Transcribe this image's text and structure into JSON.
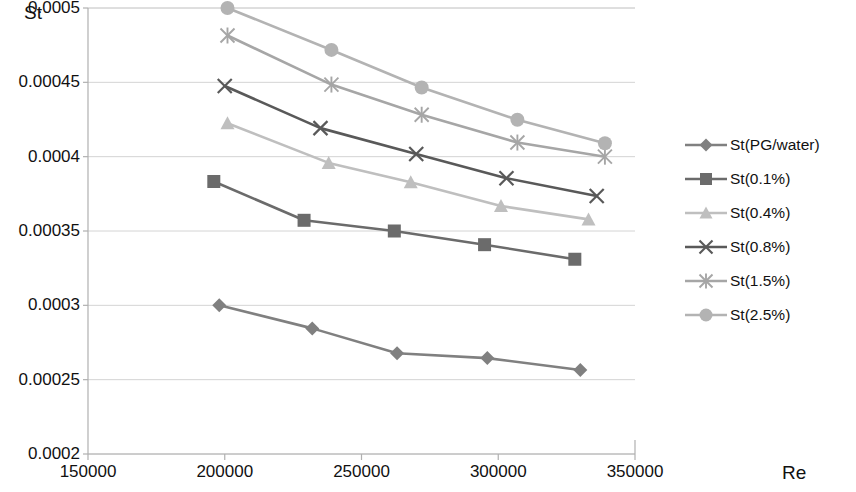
{
  "chart_data": {
    "type": "line",
    "title": "",
    "xlabel": "Re",
    "ylabel": "St",
    "xlim": [
      150000,
      350000
    ],
    "ylim": [
      0.0002,
      0.0005
    ],
    "xticks": [
      150000,
      200000,
      250000,
      300000,
      350000
    ],
    "xtick_labels": [
      "150000",
      "200000",
      "250000",
      "300000",
      "350000"
    ],
    "yticks": [
      0.0002,
      0.00025,
      0.0003,
      0.00035,
      0.0004,
      0.00045,
      0.0005
    ],
    "ytick_labels": [
      "0.0002",
      "0.00025",
      "0.0003",
      "0.00035",
      "0.0004",
      "0.00045",
      "0.0005"
    ],
    "grid": "horizontal",
    "legend_position": "right",
    "series": [
      {
        "name": "St(PG/water)",
        "marker": "diamond",
        "color": "#808080",
        "x": [
          198000,
          232000,
          263000,
          296000,
          330000
        ],
        "y": [
          0.0003,
          0.0002845,
          0.0002678,
          0.0002645,
          0.0002565
        ]
      },
      {
        "name": "St(0.1%)",
        "marker": "square",
        "color": "#6b6b6b",
        "x": [
          196000,
          229000,
          262000,
          295000,
          328000
        ],
        "y": [
          0.0003833,
          0.0003572,
          0.00035,
          0.0003408,
          0.000331
        ]
      },
      {
        "name": "St(0.4%)",
        "marker": "triangle",
        "color": "#bfbfbf",
        "x": [
          201000,
          238000,
          268000,
          301000,
          333000
        ],
        "y": [
          0.0004225,
          0.0003958,
          0.0003828,
          0.0003668,
          0.0003578
        ]
      },
      {
        "name": "St(0.8%)",
        "marker": "x",
        "color": "#595959",
        "x": [
          200000,
          235000,
          270000,
          303000,
          336000
        ],
        "y": [
          0.0004475,
          0.0004192,
          0.0004018,
          0.0003855,
          0.0003735
        ]
      },
      {
        "name": "St(1.5%)",
        "marker": "asterisk",
        "color": "#a6a6a6",
        "x": [
          201000,
          239000,
          272000,
          307000,
          339000
        ],
        "y": [
          0.0004815,
          0.0004485,
          0.0004282,
          0.0004095,
          0.0004
        ]
      },
      {
        "name": "St(2.5%)",
        "marker": "circle",
        "color": "#b3b3b3",
        "x": [
          201000,
          239000,
          272000,
          307000,
          339000
        ],
        "y": [
          0.0005,
          0.0004718,
          0.0004465,
          0.0004248,
          0.000409
        ]
      }
    ]
  }
}
